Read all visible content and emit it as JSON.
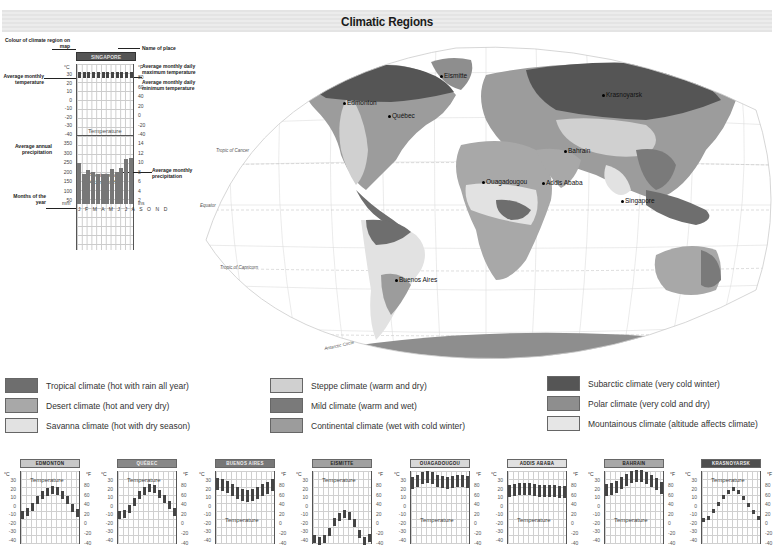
{
  "title": "Climatic Regions",
  "key_diagram": {
    "annotations": {
      "colour_of_region": "Colour of climate region on map",
      "name_of_place": "Name of place",
      "avg_monthly_temp": "Average monthly temperature",
      "avg_max_temp": "Average monthly daily maximum temperature",
      "avg_min_temp": "Average monthly daily minimum temperature",
      "avg_annual_precip": "Average annual precipitation",
      "avg_monthly_precip": "Average monthly precipitation",
      "months_of_year": "Months of the year"
    },
    "place": "SINGAPORE",
    "temp_label": "Temperature",
    "precip_label": "Precipitation",
    "precip_total": "2413mm/95in",
    "celsius_unit": "°C",
    "fahrenheit_unit": "°F",
    "mm_unit": "mm",
    "ins_unit": "ins",
    "celsius_ticks": [
      "30",
      "20",
      "10",
      "0",
      "-10",
      "-20",
      "-30",
      "-40"
    ],
    "fahrenheit_ticks": [
      "80",
      "60",
      "40",
      "20",
      "0",
      "-20",
      "-40"
    ],
    "mm_ticks": [
      "350",
      "300",
      "250",
      "200",
      "150",
      "100",
      "50"
    ],
    "ins_ticks": [
      "14",
      "12",
      "10",
      "8",
      "6",
      "4",
      "2"
    ],
    "months": "J F M A M J J A S O N D"
  },
  "map": {
    "cities": [
      "Eismitte",
      "Edmonton",
      "Québec",
      "Krasnoyarsk",
      "Bahrain",
      "Ouagadougou",
      "Addis Ababa",
      "Singapore",
      "Buenos Aires"
    ],
    "lat_lines": {
      "cancer": "Tropic of Cancer",
      "equator": "Equator",
      "capricorn": "Tropic of Capricorn",
      "antarctic": "Antarctic Circle"
    }
  },
  "legend": [
    {
      "label": "Tropical climate (hot with rain all year)",
      "color": "#6e6e6e"
    },
    {
      "label": "Desert climate (hot and very dry)",
      "color": "#a8a8a8"
    },
    {
      "label": "Savanna climate (hot with dry season)",
      "color": "#e2e2e2"
    },
    {
      "label": "Steppe climate (warm and dry)",
      "color": "#d0d0d0"
    },
    {
      "label": "Mild climate (warm and wet)",
      "color": "#7a7a7a"
    },
    {
      "label": "Continental climate (wet with cold winter)",
      "color": "#9c9c9c"
    },
    {
      "label": "Subarctic climate (very cold winter)",
      "color": "#555555"
    },
    {
      "label": "Polar climate (very cold and dry)",
      "color": "#8e8e8e"
    },
    {
      "label": "Mountainous climate (altitude affects climate)",
      "color": "#e6e6e6"
    }
  ],
  "climate_charts": [
    {
      "name": "EDMONTON",
      "header_color": "#c8c8c8",
      "temp_label": "Temperature",
      "temps": [
        -12,
        -9,
        -3,
        5,
        11,
        15,
        17,
        16,
        11,
        5,
        -4,
        -10
      ]
    },
    {
      "name": "QUÉBEC",
      "header_color": "#888888",
      "temp_label": "Temperature",
      "temps": [
        -12,
        -11,
        -5,
        3,
        11,
        16,
        19,
        18,
        12,
        6,
        -1,
        -9
      ]
    },
    {
      "name": "BUENOS AIRES",
      "header_color": "#777777",
      "temp_label": "Temperature",
      "temps": [
        24,
        23,
        21,
        17,
        14,
        11,
        10,
        11,
        14,
        17,
        20,
        23
      ]
    },
    {
      "name": "EISMITTE",
      "header_color": "#a0a0a0",
      "temp_label": "Temperature",
      "temps": [
        -41,
        -43,
        -40,
        -32,
        -21,
        -15,
        -11,
        -14,
        -22,
        -35,
        -43,
        -39
      ]
    },
    {
      "name": "OUAGADOUGOU",
      "header_color": "#d8d8d8",
      "temp_label": "Temperature",
      "temps": [
        25,
        28,
        31,
        32,
        31,
        28,
        26,
        25,
        26,
        28,
        28,
        26
      ]
    },
    {
      "name": "ADDIS ABABA",
      "header_color": "#e0e0e0",
      "temp_label": "Temperature",
      "temps": [
        16,
        17,
        18,
        18,
        18,
        17,
        16,
        16,
        16,
        16,
        15,
        15
      ]
    },
    {
      "name": "BAHRAIN",
      "header_color": "#a8a8a8",
      "temp_label": "Temperature",
      "temps": [
        17,
        18,
        21,
        25,
        29,
        32,
        33,
        34,
        31,
        28,
        24,
        19
      ]
    },
    {
      "name": "KRASNOYARSK",
      "header_color": "#4e4e4e",
      "temp_label": "Temperature",
      "temps": [
        -18,
        -16,
        -8,
        1,
        9,
        15,
        18,
        15,
        8,
        0,
        -9,
        -16
      ]
    }
  ],
  "chart_data": {
    "type": "line",
    "categories": [
      "J",
      "F",
      "M",
      "A",
      "M",
      "J",
      "J",
      "A",
      "S",
      "O",
      "N",
      "D"
    ],
    "ylim": [
      -40,
      35
    ],
    "series": [
      {
        "name": "Singapore",
        "values": [
          26,
          27,
          27,
          27,
          28,
          27,
          27,
          27,
          27,
          27,
          27,
          26
        ]
      },
      {
        "name": "Edmonton",
        "values": [
          -12,
          -9,
          -3,
          5,
          11,
          15,
          17,
          16,
          11,
          5,
          -4,
          -10
        ]
      },
      {
        "name": "Québec",
        "values": [
          -12,
          -11,
          -5,
          3,
          11,
          16,
          19,
          18,
          12,
          6,
          -1,
          -9
        ]
      },
      {
        "name": "Buenos Aires",
        "values": [
          24,
          23,
          21,
          17,
          14,
          11,
          10,
          11,
          14,
          17,
          20,
          23
        ]
      },
      {
        "name": "Eismitte",
        "values": [
          -41,
          -43,
          -40,
          -32,
          -21,
          -15,
          -11,
          -14,
          -22,
          -35,
          -43,
          -39
        ]
      },
      {
        "name": "Ouagadougou",
        "values": [
          25,
          28,
          31,
          32,
          31,
          28,
          26,
          25,
          26,
          28,
          28,
          26
        ]
      },
      {
        "name": "Addis Ababa",
        "values": [
          16,
          17,
          18,
          18,
          18,
          17,
          16,
          16,
          16,
          16,
          15,
          15
        ]
      },
      {
        "name": "Bahrain",
        "values": [
          17,
          18,
          21,
          25,
          29,
          32,
          33,
          34,
          31,
          28,
          24,
          19
        ]
      },
      {
        "name": "Krasnoyarsk",
        "values": [
          -18,
          -16,
          -8,
          1,
          9,
          15,
          18,
          15,
          8,
          0,
          -9,
          -16
        ]
      }
    ],
    "singapore_precip_mm": [
      230,
      170,
      190,
      180,
      170,
      170,
      170,
      195,
      180,
      205,
      255,
      260
    ]
  }
}
